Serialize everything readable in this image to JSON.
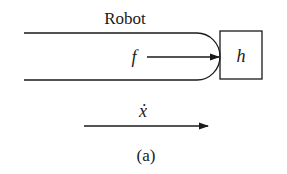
{
  "diagram": {
    "robot_label": "Robot",
    "force_label": "f",
    "environment_label": "h",
    "velocity_label": "ẋ",
    "caption": "(a)",
    "stroke_color": "#1a1a1a",
    "background": "#ffffff"
  }
}
